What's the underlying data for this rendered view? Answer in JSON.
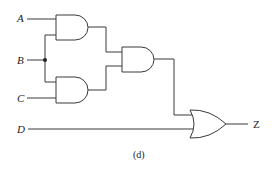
{
  "diagram": {
    "type": "logic-circuit",
    "inputs": [
      {
        "id": "A",
        "label": "A"
      },
      {
        "id": "B",
        "label": "B"
      },
      {
        "id": "C",
        "label": "C"
      },
      {
        "id": "D",
        "label": "D"
      }
    ],
    "gates": [
      {
        "id": "and1",
        "type": "AND",
        "inputs": [
          "A",
          "B"
        ]
      },
      {
        "id": "and2",
        "type": "AND",
        "inputs": [
          "B",
          "C"
        ]
      },
      {
        "id": "and3",
        "type": "AND",
        "inputs": [
          "and1",
          "and2"
        ]
      },
      {
        "id": "or1",
        "type": "OR",
        "inputs": [
          "and3",
          "D"
        ]
      }
    ],
    "output": {
      "id": "Z",
      "label": "Z"
    },
    "caption": "(d)"
  }
}
